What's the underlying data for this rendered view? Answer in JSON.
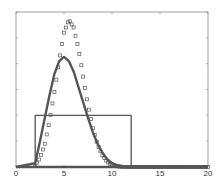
{
  "chart_data": {
    "type": "line",
    "title": "",
    "xlabel": "",
    "ylabel": "",
    "xlim": [
      0,
      20
    ],
    "ylim": [
      0,
      6
    ],
    "xticks": [
      0,
      5,
      10,
      15,
      20
    ],
    "xtick_labels": [
      "0",
      "5",
      "10",
      "15",
      "20"
    ],
    "yticks": [
      0,
      1,
      2,
      3,
      4,
      5,
      6
    ],
    "ytick_labels": [],
    "grid": false,
    "legend": null,
    "series": [
      {
        "name": "box-input",
        "style": "solid-line",
        "color": "#555555",
        "x": [
          0,
          2,
          2,
          12,
          12,
          20
        ],
        "y": [
          0,
          0,
          2,
          2,
          0,
          0
        ]
      },
      {
        "name": "response-solid",
        "style": "thick-line",
        "color": "#555555",
        "x": [
          0,
          2,
          2.5,
          3,
          3.5,
          4,
          4.5,
          5,
          5.5,
          6,
          6.5,
          7,
          7.5,
          8,
          8.5,
          9,
          9.5,
          10,
          10.5,
          11,
          12,
          20
        ],
        "y": [
          0,
          0.15,
          1.0,
          1.9,
          2.8,
          3.6,
          4.1,
          4.26,
          4.1,
          3.7,
          3.1,
          2.5,
          1.9,
          1.35,
          0.9,
          0.55,
          0.3,
          0.15,
          0.07,
          0.03,
          0,
          0
        ]
      },
      {
        "name": "response-squares",
        "style": "square-markers",
        "color": "#555555",
        "x": [
          0,
          2,
          2.5,
          3,
          3.5,
          4,
          4.5,
          5,
          5.5,
          6,
          6.5,
          7,
          7.5,
          8,
          8.5,
          9,
          9.5,
          10,
          10.5,
          11,
          12,
          20
        ],
        "y": [
          0,
          0.05,
          0.35,
          0.9,
          1.8,
          2.9,
          4.1,
          5.2,
          5.7,
          5.4,
          4.6,
          3.5,
          2.4,
          1.5,
          0.85,
          0.45,
          0.2,
          0.08,
          0.03,
          0.01,
          0,
          0
        ]
      }
    ]
  }
}
